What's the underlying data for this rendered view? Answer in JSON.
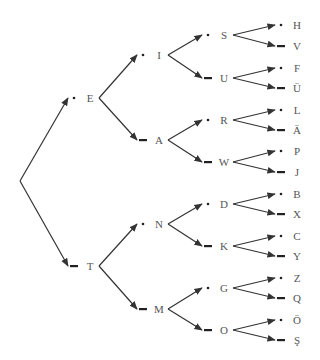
{
  "colors": {
    "edge": "#333333",
    "label": "#555555",
    "symbol": "#222222"
  },
  "root": {
    "x": 20,
    "y": 181
  },
  "nodes": [
    {
      "id": "E",
      "letter": "E",
      "symbol": "dot",
      "level": 1,
      "x": 90,
      "y": 98,
      "parent": "root"
    },
    {
      "id": "T",
      "letter": "T",
      "symbol": "dash",
      "level": 1,
      "x": 90,
      "y": 266,
      "parent": "root"
    },
    {
      "id": "I",
      "letter": "I",
      "symbol": "dot",
      "level": 2,
      "x": 159,
      "y": 55,
      "parent": "E"
    },
    {
      "id": "A",
      "letter": "A",
      "symbol": "dash",
      "level": 2,
      "x": 159,
      "y": 140,
      "parent": "E"
    },
    {
      "id": "N",
      "letter": "N",
      "symbol": "dot",
      "level": 2,
      "x": 159,
      "y": 224,
      "parent": "T"
    },
    {
      "id": "M",
      "letter": "M",
      "symbol": "dash",
      "level": 2,
      "x": 159,
      "y": 309,
      "parent": "T"
    },
    {
      "id": "S",
      "letter": "S",
      "symbol": "dot",
      "level": 3,
      "x": 224,
      "y": 35,
      "parent": "I"
    },
    {
      "id": "U",
      "letter": "U",
      "symbol": "dash",
      "level": 3,
      "x": 224,
      "y": 78,
      "parent": "I"
    },
    {
      "id": "R",
      "letter": "R",
      "symbol": "dot",
      "level": 3,
      "x": 224,
      "y": 120,
      "parent": "A"
    },
    {
      "id": "W",
      "letter": "W",
      "symbol": "dash",
      "level": 3,
      "x": 224,
      "y": 162,
      "parent": "A"
    },
    {
      "id": "D",
      "letter": "D",
      "symbol": "dot",
      "level": 3,
      "x": 224,
      "y": 204,
      "parent": "N"
    },
    {
      "id": "K",
      "letter": "K",
      "symbol": "dash",
      "level": 3,
      "x": 224,
      "y": 246,
      "parent": "N"
    },
    {
      "id": "G",
      "letter": "G",
      "symbol": "dot",
      "level": 3,
      "x": 224,
      "y": 288,
      "parent": "M"
    },
    {
      "id": "O",
      "letter": "O",
      "symbol": "dash",
      "level": 3,
      "x": 224,
      "y": 330,
      "parent": "M"
    },
    {
      "id": "H",
      "letter": "H",
      "symbol": "dot",
      "level": 4,
      "x": 297,
      "y": 25,
      "parent": "S"
    },
    {
      "id": "V",
      "letter": "V",
      "symbol": "dash",
      "level": 4,
      "x": 297,
      "y": 46,
      "parent": "S"
    },
    {
      "id": "F",
      "letter": "F",
      "symbol": "dot",
      "level": 4,
      "x": 297,
      "y": 68,
      "parent": "U"
    },
    {
      "id": "UE",
      "letter": "Ü",
      "symbol": "dash",
      "level": 4,
      "x": 297,
      "y": 88,
      "parent": "U"
    },
    {
      "id": "L",
      "letter": "L",
      "symbol": "dot",
      "level": 4,
      "x": 297,
      "y": 110,
      "parent": "R"
    },
    {
      "id": "AE",
      "letter": "Ä",
      "symbol": "dash",
      "level": 4,
      "x": 297,
      "y": 130,
      "parent": "R"
    },
    {
      "id": "P",
      "letter": "P",
      "symbol": "dot",
      "level": 4,
      "x": 297,
      "y": 151,
      "parent": "W"
    },
    {
      "id": "J",
      "letter": "J",
      "symbol": "dash",
      "level": 4,
      "x": 297,
      "y": 172,
      "parent": "W"
    },
    {
      "id": "B",
      "letter": "B",
      "symbol": "dot",
      "level": 4,
      "x": 297,
      "y": 194,
      "parent": "D"
    },
    {
      "id": "X",
      "letter": "X",
      "symbol": "dash",
      "level": 4,
      "x": 297,
      "y": 214,
      "parent": "D"
    },
    {
      "id": "C",
      "letter": "C",
      "symbol": "dot",
      "level": 4,
      "x": 297,
      "y": 236,
      "parent": "K"
    },
    {
      "id": "Y",
      "letter": "Y",
      "symbol": "dash",
      "level": 4,
      "x": 297,
      "y": 256,
      "parent": "K"
    },
    {
      "id": "Z",
      "letter": "Z",
      "symbol": "dot",
      "level": 4,
      "x": 297,
      "y": 278,
      "parent": "G"
    },
    {
      "id": "Q",
      "letter": "Q",
      "symbol": "dash",
      "level": 4,
      "x": 297,
      "y": 298,
      "parent": "G"
    },
    {
      "id": "OE",
      "letter": "Ö",
      "symbol": "dot",
      "level": 4,
      "x": 297,
      "y": 320,
      "parent": "O"
    },
    {
      "id": "SH",
      "letter": "Ş",
      "symbol": "dash",
      "level": 4,
      "x": 297,
      "y": 340,
      "parent": "O"
    }
  ]
}
